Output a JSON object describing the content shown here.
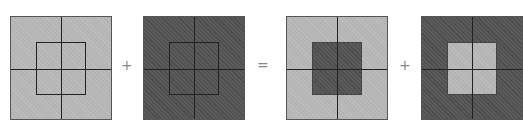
{
  "diagram": {
    "operators": [
      "+",
      "=",
      "+"
    ],
    "squares": [
      {
        "outer": "light",
        "inner": "light",
        "inner_outlined": true
      },
      {
        "outer": "dark",
        "inner": "dark",
        "inner_outlined": true
      },
      {
        "outer": "light",
        "inner": "dark",
        "inner_outlined": false
      },
      {
        "outer": "dark",
        "inner": "light",
        "inner_outlined": false
      }
    ],
    "colors": {
      "light": "#b4b4b4",
      "dark": "#5a5a5a",
      "line": "#222222"
    }
  }
}
